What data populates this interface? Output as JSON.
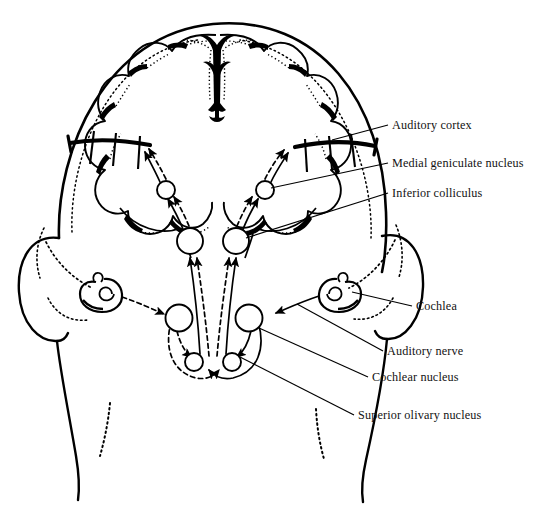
{
  "figure": {
    "background_color": "#ffffff",
    "ink_color": "#000000",
    "text_color": "#121212",
    "width": 540,
    "height": 524
  },
  "labels": [
    {
      "id": "auditory-cortex",
      "text": "Auditory cortex",
      "x": 392,
      "y": 129,
      "leader_from": [
        332,
        140
      ],
      "leader_to": [
        388,
        125
      ]
    },
    {
      "id": "medial-geniculate-nucleus",
      "text": "Medial geniculate nucleus",
      "x": 392,
      "y": 167,
      "leader_from": [
        268,
        190
      ],
      "leader_to": [
        388,
        163
      ]
    },
    {
      "id": "inferior-colliculus",
      "text": "Inferior colliculus",
      "x": 392,
      "y": 197,
      "leader_from": [
        241,
        240
      ],
      "leader_to": [
        388,
        193
      ]
    },
    {
      "id": "cochlea",
      "text": "Cochlea",
      "x": 416,
      "y": 310,
      "leader_from": [
        338,
        290
      ],
      "leader_to": [
        412,
        306
      ]
    },
    {
      "id": "auditory-nerve",
      "text": "Auditory nerve",
      "x": 387,
      "y": 355,
      "leader_from": [
        297,
        304
      ],
      "leader_to": [
        383,
        351
      ]
    },
    {
      "id": "cochlear-nucleus",
      "text": "Cochlear nucleus",
      "x": 372,
      "y": 381,
      "leader_from": [
        255,
        320
      ],
      "leader_to": [
        368,
        377
      ]
    },
    {
      "id": "superior-olivary-nucleus",
      "text": "Superior olivary nucleus",
      "x": 358,
      "y": 419,
      "leader_from": [
        238,
        358
      ],
      "leader_to": [
        354,
        415
      ]
    }
  ],
  "structures": {
    "head_outline": "posterior view of head, skull and neck",
    "brain": "cerebral hemispheres with lobed gyri and longitudinal fissure",
    "ears": "left and right outer ear with ear canal",
    "cochleae": "spiral cochlea at each ear",
    "nuclei": [
      {
        "name": "cochlear-nucleus-left",
        "cx": 179,
        "cy": 318,
        "r": 13
      },
      {
        "name": "cochlear-nucleus-right",
        "cx": 249,
        "cy": 318,
        "r": 13
      },
      {
        "name": "superior-olivary-nucleus-left",
        "cx": 194,
        "cy": 360,
        "r": 9
      },
      {
        "name": "superior-olivary-nucleus-right",
        "cx": 232,
        "cy": 360,
        "r": 9
      },
      {
        "name": "inferior-colliculus-left",
        "cx": 190,
        "cy": 241,
        "r": 13
      },
      {
        "name": "inferior-colliculus-right",
        "cx": 236,
        "cy": 241,
        "r": 13
      },
      {
        "name": "medial-geniculate-nucleus-left",
        "cx": 166,
        "cy": 190,
        "r": 9
      },
      {
        "name": "medial-geniculate-nucleus-right",
        "cx": 265,
        "cy": 190,
        "r": 9
      }
    ],
    "pathways": {
      "solid": "ipsilateral / primary ascending auditory pathway",
      "dashed": "contralateral crossed auditory pathway"
    }
  }
}
